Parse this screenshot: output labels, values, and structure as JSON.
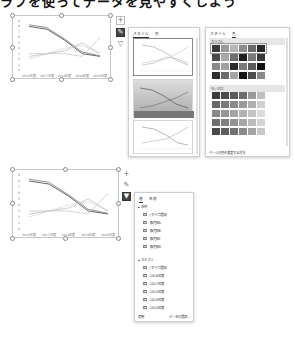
{
  "page": {
    "title_fragment": "ラフを使ってデータを見やすくしよう"
  },
  "chart_data": [
    {
      "type": "line",
      "title": "",
      "categories": [
        "2016年度",
        "2017年度",
        "2018年度",
        "2019年度",
        "2020年度"
      ],
      "y_ticks": [
        0,
        1,
        2,
        3,
        4,
        5,
        6,
        7,
        8,
        9
      ],
      "ylim": [
        0,
        9
      ],
      "grid": false,
      "series": [
        {
          "name": "販売額A",
          "values": [
            8.0,
            7.5,
            5.5,
            3.0,
            2.5
          ],
          "color": "#555555"
        },
        {
          "name": "販売額B",
          "values": [
            8.3,
            7.8,
            5.7,
            3.3,
            2.6
          ],
          "color": "#888888"
        },
        {
          "name": "販売額C",
          "values": [
            2.5,
            3.0,
            3.5,
            5.0,
            3.0
          ],
          "color": "#aaaaaa"
        },
        {
          "name": "販売額D",
          "values": [
            3.0,
            3.0,
            3.0,
            2.5,
            6.0
          ],
          "color": "#bbbbbb"
        },
        {
          "name": "販売額E",
          "values": [
            2.0,
            3.0,
            4.0,
            4.5,
            3.0
          ],
          "color": "#cccccc"
        }
      ]
    }
  ],
  "chart_top": {
    "x_labels": [
      "2016年度",
      "2017年度",
      "2018年度",
      "2019年度",
      "2020年度"
    ],
    "y_labels": [
      "9",
      "8",
      "7",
      "6",
      "5",
      "4",
      "3",
      "2",
      "1",
      "0"
    ]
  },
  "chart_bottom": {
    "x_labels": [
      "2016年度",
      "2017年度",
      "2018年度",
      "2019年度",
      "2020年度"
    ],
    "y_labels": [
      "9",
      "8",
      "7",
      "6",
      "5",
      "4",
      "3",
      "2",
      "1",
      "0"
    ]
  },
  "side_buttons_top": {
    "add": "+",
    "style": "✎",
    "filter": "▽"
  },
  "side_buttons_bottom": {
    "add": "+",
    "style": "✎",
    "filter": "▼"
  },
  "style_panel": {
    "tabs": [
      "スタイル",
      "色"
    ],
    "active_tab": "スタイル"
  },
  "color_panel": {
    "tabs": [
      "スタイル",
      "色"
    ],
    "active_tab": "色",
    "sections": [
      {
        "label": "カラフル",
        "rows": [
          [
            "#3a3a3a",
            "#9a9a9a",
            "#b5b5b5",
            "#8e8e8e",
            "#6a6a6a",
            "#2a2a2a"
          ],
          [
            "#4a4a4a",
            "#a8a8a8",
            "#6e6e6e",
            "#1f1f1f",
            "#7a7a7a",
            "#3a3a3a"
          ],
          [
            "#8a8a8a",
            "#a0a0a0",
            "#2a2a2a",
            "#7a7a7a",
            "#5a5a5a",
            "#101010"
          ],
          [
            "#2e2e2e",
            "#6a6a6a",
            "#a5a5a5",
            "#151515",
            "#4e4e4e",
            "#8a8a8a"
          ]
        ]
      },
      {
        "label": "モノクロ",
        "rows": [
          [
            "#3c3c3c",
            "#4a4a4a",
            "#5a5a5a",
            "#6c6c6c",
            "#9a9a9a",
            "#c0c0c0"
          ],
          [
            "#6a6a6a",
            "#7a7a7a",
            "#8a8a8a",
            "#9a9a9a",
            "#b0b0b0",
            "#cfcfcf"
          ],
          [
            "#888888",
            "#969696",
            "#a4a4a4",
            "#b2b2b2",
            "#c4c4c4",
            "#dcdcdc"
          ],
          [
            "#6e6e6e",
            "#808080",
            "#929292",
            "#a6a6a6",
            "#bcbcbc",
            "#d4d4d4"
          ],
          [
            "#4a4a4a",
            "#5e5e5e",
            "#727272",
            "#8a8a8a",
            "#a4a4a4",
            "#c8c8c8"
          ]
        ]
      }
    ],
    "footer_link": "ページの色を変更する方法"
  },
  "filter_panel": {
    "tabs": [
      "値",
      "名前"
    ],
    "active_tab": "値",
    "series_group": {
      "label": "系列",
      "items": [
        {
          "label": "(すべて選択)",
          "checked": true
        },
        {
          "label": "販売額A",
          "checked": true
        },
        {
          "label": "販売額B",
          "checked": true
        },
        {
          "label": "販売額C",
          "checked": true
        },
        {
          "label": "販売額D",
          "checked": true
        }
      ]
    },
    "category_group": {
      "label": "カテゴリ",
      "items": [
        {
          "label": "(すべて選択)",
          "checked": true
        },
        {
          "label": "2016年度",
          "checked": true
        },
        {
          "label": "2017年度",
          "checked": true
        },
        {
          "label": "2018年度",
          "checked": true
        },
        {
          "label": "2019年度",
          "checked": true
        },
        {
          "label": "2020年度",
          "checked": true
        }
      ]
    },
    "apply_label": "適用",
    "select_data_label": "データの選択..."
  }
}
